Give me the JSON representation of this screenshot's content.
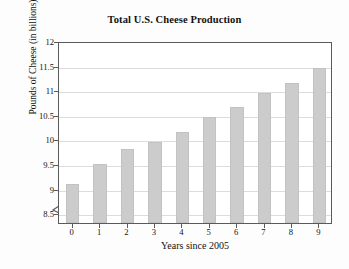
{
  "chart_data": {
    "type": "bar",
    "title": "Total U.S. Cheese Production",
    "xlabel": "Years since 2005",
    "ylabel": "Pounds of Cheese (in billions)",
    "categories": [
      "0",
      "1",
      "2",
      "3",
      "4",
      "5",
      "6",
      "7",
      "8",
      "9"
    ],
    "values": [
      9.1,
      9.5,
      9.8,
      9.95,
      10.15,
      10.45,
      10.65,
      10.95,
      11.15,
      11.45
    ],
    "ylim": [
      8.3,
      12
    ],
    "ytick_values": [
      8.5,
      9,
      10,
      9.5,
      10.5,
      11,
      11.5,
      12
    ],
    "ytick_labels": [
      "8.5",
      "9",
      "9.5",
      "10",
      "10.5",
      "11",
      "11.5",
      "12"
    ],
    "yticks": [
      8.5,
      9,
      9.5,
      10,
      10.5,
      11,
      11.5,
      12
    ],
    "grid": true,
    "legend": "none",
    "axis_break": true,
    "axis_break_symbol": "zigzag",
    "bar_color": "#cccccc",
    "bar_edge_color": "#c2c2c2",
    "grid_color": "#dcdcdc",
    "axis_color": "#5a5a5a",
    "background_color": "#ffffff"
  }
}
